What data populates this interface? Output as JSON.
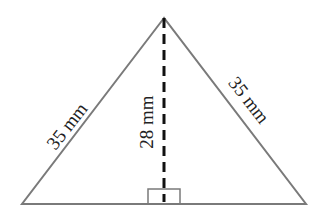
{
  "diagram": {
    "type": "isosceles-triangle",
    "labels": {
      "left_side": "35 mm",
      "right_side": "35 mm",
      "height": "28 mm"
    },
    "colors": {
      "edge": "#7a7a7a",
      "height_line": "#111111",
      "text": "#222222"
    }
  }
}
